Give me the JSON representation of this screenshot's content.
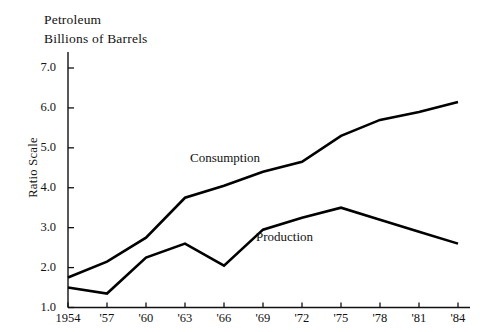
{
  "chart_data": {
    "type": "line",
    "title": "Petroleum\nBillions of Barrels",
    "title_lines": [
      "Petroleum",
      "Billions of Barrels"
    ],
    "xlabel": "",
    "ylabel": "Ratio Scale",
    "scale": "ratio",
    "grid": false,
    "legend_position": "inline-annotation",
    "x": [
      "1954",
      "1957",
      "1960",
      "1963",
      "1966",
      "1969",
      "1972",
      "1975",
      "1978",
      "1981",
      "1984"
    ],
    "categories": [
      "1954",
      "'57",
      "'60",
      "'63",
      "'66",
      "'69",
      "'72",
      "'75",
      "'78",
      "'81",
      "'84"
    ],
    "xtick_labels": [
      "1954",
      "'57",
      "'60",
      "'63",
      "'66",
      "'69",
      "'72",
      "'75",
      "'78",
      "'81",
      "'84"
    ],
    "ytick_labels": [
      "7.0",
      "6.0",
      "5.0",
      "4.0",
      "3.0",
      "2.0",
      "1.0"
    ],
    "ytick_values": [
      7.0,
      6.0,
      5.0,
      4.0,
      3.0,
      2.0,
      1.0
    ],
    "ylim": [
      1.0,
      7.0
    ],
    "series": [
      {
        "name": "Consumption",
        "color": "#000000",
        "values": [
          1.75,
          2.15,
          2.75,
          3.75,
          4.05,
          4.4,
          4.65,
          5.3,
          5.7,
          5.9,
          6.15
        ]
      },
      {
        "name": "Production",
        "color": "#000000",
        "values": [
          1.5,
          1.35,
          2.25,
          2.6,
          2.05,
          2.95,
          3.25,
          3.5,
          3.2,
          2.9,
          2.6
        ]
      }
    ],
    "annotations": [
      {
        "text": "Consumption",
        "near_series": "Consumption"
      },
      {
        "text": "Production",
        "near_series": "Production"
      }
    ]
  },
  "axis": {
    "ylabel": "Ratio Scale",
    "ticks_y": [
      "7.0",
      "6.0",
      "5.0",
      "4.0",
      "3.0",
      "2.0",
      "1.0"
    ],
    "ticks_x": [
      "1954",
      "'57",
      "'60",
      "'63",
      "'66",
      "'69",
      "'72",
      "'75",
      "'78",
      "'81",
      "'84"
    ]
  },
  "header": {
    "line1": "Petroleum",
    "line2": "Billions of Barrels"
  },
  "labels": {
    "consumption": "Consumption",
    "production": "Production"
  },
  "colors": {
    "background": "#ffffff",
    "ink": "#111111",
    "line": "#000000"
  }
}
